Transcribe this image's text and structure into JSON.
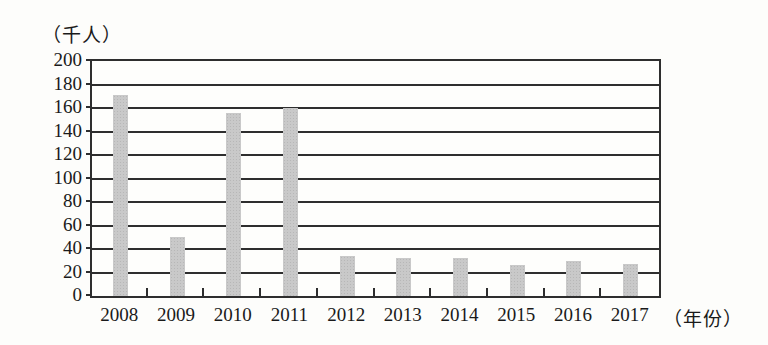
{
  "chart_data": {
    "type": "bar",
    "title": "",
    "unit_label_y": "（千人）",
    "unit_label_x": "（年份）",
    "categories": [
      "2008",
      "2009",
      "2010",
      "2011",
      "2012",
      "2013",
      "2014",
      "2015",
      "2016",
      "2017"
    ],
    "values": [
      171,
      50,
      156,
      160,
      34,
      32,
      32,
      26,
      30,
      27
    ],
    "ylim": [
      0,
      200
    ],
    "ytick_step": 20,
    "yticks": [
      0,
      20,
      40,
      60,
      80,
      100,
      120,
      140,
      160,
      180,
      200
    ],
    "grid": "horizontal",
    "legend_position": "none",
    "bar_color": "#c9c9c9",
    "axis_color": "#2e2e2e",
    "text_color": "#1a1a1a"
  }
}
